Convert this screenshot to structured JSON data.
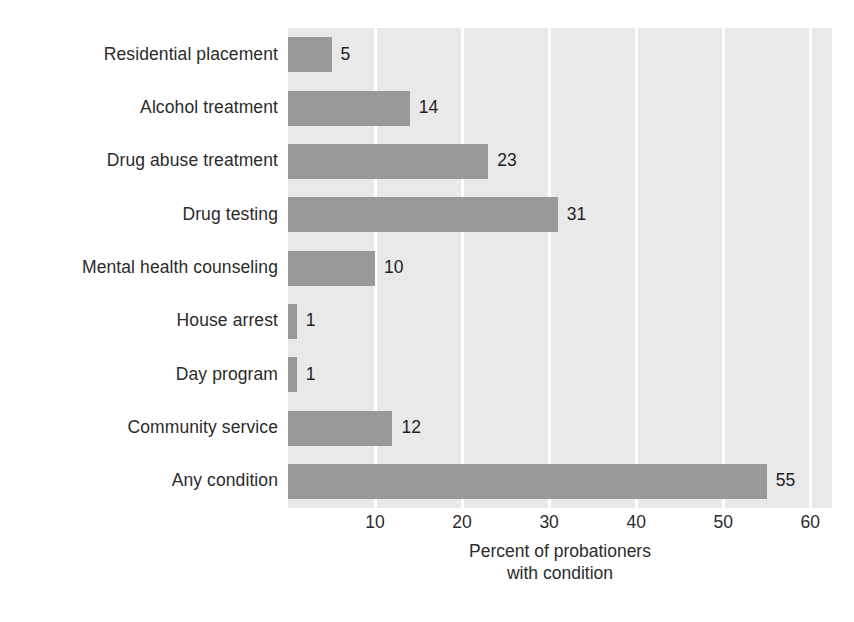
{
  "chart_data": {
    "type": "bar",
    "orientation": "horizontal",
    "title": "",
    "subtitle": "",
    "xlabel": "Percent of probationers with condition",
    "xlabel_lines": [
      "Percent of probationers",
      "with condition"
    ],
    "ylabel": "",
    "categories": [
      "Residential placement",
      "Alcohol treatment",
      "Drug abuse treatment",
      "Drug testing",
      "Mental health counseling",
      "House arrest",
      "Day program",
      "Community service",
      "Any condition"
    ],
    "values": [
      5,
      14,
      23,
      31,
      10,
      1,
      1,
      12,
      55
    ],
    "data_labels": [
      "5",
      "14",
      "23",
      "31",
      "10",
      "1",
      "1",
      "12",
      "55"
    ],
    "xlim": [
      0,
      62.5
    ],
    "xticks": [
      10,
      20,
      30,
      40,
      50,
      60
    ],
    "xtick_labels": [
      "10",
      "20",
      "30",
      "40",
      "50",
      "60"
    ],
    "grid": "vertical-only",
    "legend": "none",
    "colors": {
      "bar": "#999999",
      "plot_background": "#e9e9e9",
      "gridline": "#ffffff",
      "text": "#2b2b2b",
      "page_background": "#ffffff"
    }
  }
}
